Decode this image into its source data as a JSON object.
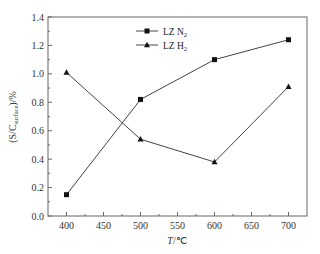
{
  "chart_data": {
    "type": "line",
    "title": "",
    "xlabel": "T/°C",
    "ylabel": "(S/C_surface)/%",
    "x": [
      400,
      500,
      600,
      700
    ],
    "xlim": [
      375,
      725
    ],
    "ylim": [
      0.0,
      1.4
    ],
    "xticks": [
      400,
      450,
      500,
      550,
      600,
      650,
      700
    ],
    "xtick_labels": [
      "400",
      "450",
      "500",
      "550",
      "600",
      "650",
      "700"
    ],
    "yticks": [
      0.0,
      0.2,
      0.4,
      0.6,
      0.8,
      1.0,
      1.2,
      1.4
    ],
    "ytick_labels": [
      "0.0",
      "0.2",
      "0.4",
      "0.6",
      "0.8",
      "1.0",
      "1.2",
      "1.4"
    ],
    "grid": false,
    "legend_position": "upper right (inside)",
    "series": [
      {
        "name": "LZ N2",
        "marker": "square",
        "values": [
          0.15,
          0.82,
          1.1,
          1.24
        ]
      },
      {
        "name": "LZ H2",
        "marker": "triangle",
        "values": [
          1.01,
          0.54,
          0.38,
          0.91
        ]
      }
    ]
  },
  "labels": {
    "xlabel_italic": "T",
    "xlabel_unit": "/℃",
    "ylabel_main": "(S/C",
    "ylabel_sub": "surface",
    "ylabel_tail": ")/%",
    "legend": [
      {
        "prefix": "LZ N",
        "sub": "2"
      },
      {
        "prefix": "LZ H",
        "sub": "2"
      }
    ]
  }
}
